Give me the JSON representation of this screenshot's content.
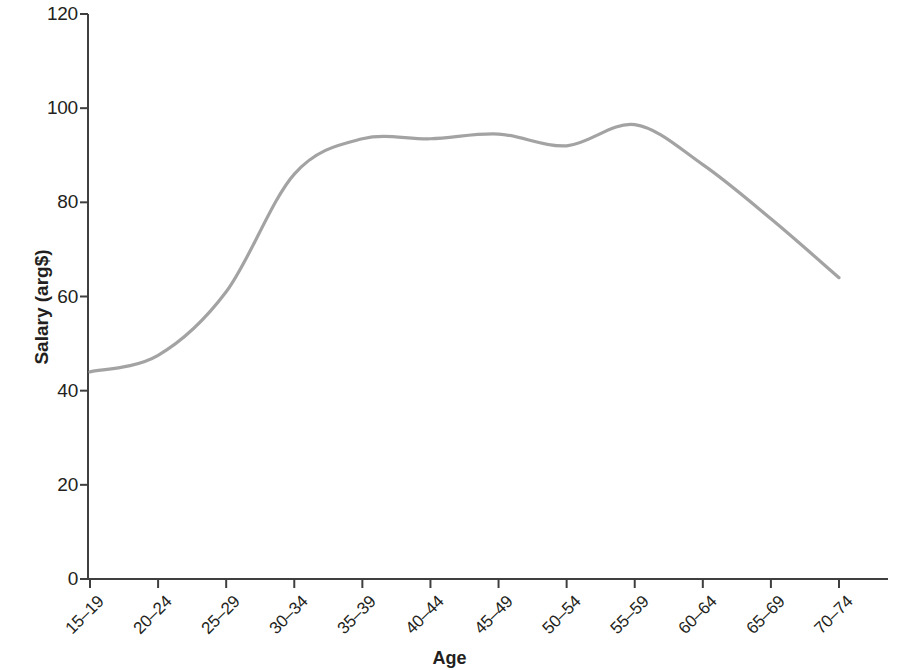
{
  "chart_data": {
    "type": "line",
    "title": "",
    "xlabel": "Age",
    "ylabel": "Salary (arg$)",
    "categories": [
      "15–19",
      "20–24",
      "25–29",
      "30–34",
      "35–39",
      "40–44",
      "45–49",
      "50–54",
      "55–59",
      "60–64",
      "65–69",
      "70–74"
    ],
    "values": [
      44,
      47.5,
      61,
      86,
      93.5,
      93.5,
      94.5,
      92,
      96.5,
      88,
      76.5,
      64
    ],
    "series": [
      {
        "name": "Salary",
        "values": [
          44,
          47.5,
          61,
          86,
          93.5,
          93.5,
          94.5,
          92,
          96.5,
          88,
          76.5,
          64
        ],
        "color": "#a3a3a3"
      }
    ],
    "ylim": [
      0,
      120
    ],
    "yticks": [
      0,
      20,
      40,
      60,
      80,
      100,
      120
    ],
    "ytick_labels": [
      "0",
      "20",
      "40",
      "60",
      "80",
      "100",
      "120"
    ],
    "grid": false,
    "legend": false,
    "legend_position": "none",
    "line_color": "#a3a3a3",
    "axis_color": "#3f3f3f",
    "smoothing": "spline"
  }
}
